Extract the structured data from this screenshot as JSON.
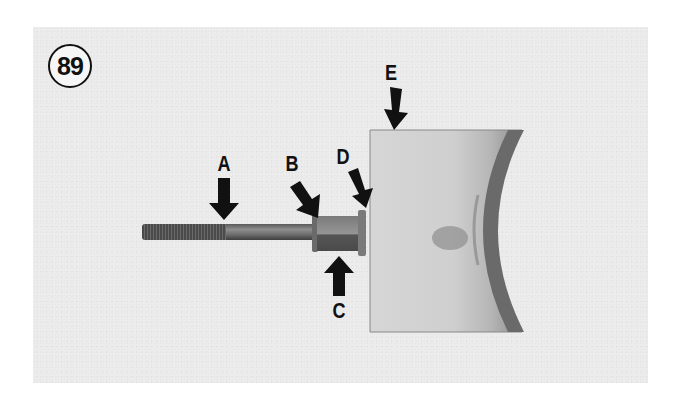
{
  "figure": {
    "number": "89",
    "labels": {
      "A": "A",
      "B": "B",
      "C": "C",
      "D": "D",
      "E": "E"
    },
    "parts": {
      "A": "threaded-rod",
      "B": "nut-edge",
      "C": "nut",
      "D": "washer",
      "E": "bearing-shell"
    },
    "colors": {
      "background": "#ececec",
      "ink": "#111111"
    }
  }
}
